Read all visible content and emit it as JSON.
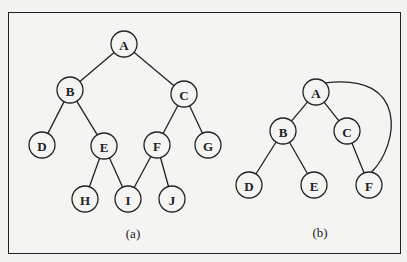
{
  "figure": {
    "panels": [
      {
        "id": "a",
        "caption": "(a)",
        "caption_pos": [
          133,
          238
        ],
        "nodes": [
          {
            "label": "A",
            "x": 124,
            "y": 44
          },
          {
            "label": "B",
            "x": 70,
            "y": 90
          },
          {
            "label": "C",
            "x": 184,
            "y": 94
          },
          {
            "label": "D",
            "x": 42,
            "y": 145
          },
          {
            "label": "E",
            "x": 104,
            "y": 146
          },
          {
            "label": "F",
            "x": 157,
            "y": 145
          },
          {
            "label": "G",
            "x": 208,
            "y": 145
          },
          {
            "label": "H",
            "x": 85,
            "y": 199
          },
          {
            "label": "I",
            "x": 128,
            "y": 199
          },
          {
            "label": "J",
            "x": 172,
            "y": 199
          }
        ],
        "edges": [
          [
            "A",
            "B"
          ],
          [
            "A",
            "C"
          ],
          [
            "B",
            "D"
          ],
          [
            "B",
            "E"
          ],
          [
            "C",
            "F"
          ],
          [
            "C",
            "G"
          ],
          [
            "E",
            "H"
          ],
          [
            "E",
            "I"
          ],
          [
            "F",
            "I"
          ],
          [
            "F",
            "J"
          ]
        ]
      },
      {
        "id": "b",
        "caption": "(b)",
        "caption_pos": [
          320,
          237
        ],
        "nodes": [
          {
            "label": "A",
            "x": 316,
            "y": 92
          },
          {
            "label": "B",
            "x": 283,
            "y": 131
          },
          {
            "label": "C",
            "x": 347,
            "y": 131
          },
          {
            "label": "D",
            "x": 249,
            "y": 185
          },
          {
            "label": "E",
            "x": 314,
            "y": 185
          },
          {
            "label": "F",
            "x": 369,
            "y": 185
          }
        ],
        "edges": [
          [
            "A",
            "B"
          ],
          [
            "A",
            "C"
          ],
          [
            "B",
            "D"
          ],
          [
            "B",
            "E"
          ],
          [
            "C",
            "F"
          ]
        ],
        "arcs": [
          [
            "A",
            "F"
          ]
        ]
      }
    ],
    "node_radius": 13
  }
}
